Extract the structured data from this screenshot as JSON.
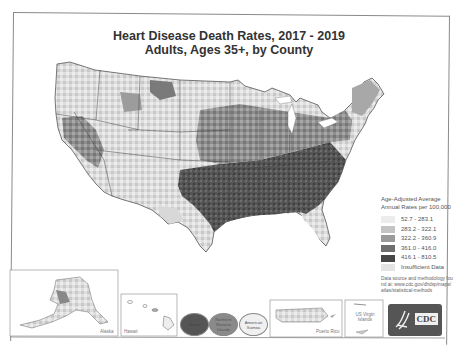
{
  "title": {
    "line1": "Heart Disease Death Rates, 2017 - 2019",
    "line2": "Adults, Ages 35+, by County"
  },
  "legend": {
    "title": "Age-Adjusted Average Annual Rates per 100,000",
    "classes": [
      {
        "label": "52.7 - 283.1",
        "color": "#ececec"
      },
      {
        "label": "283.2 - 322.1",
        "color": "#c4c4c4"
      },
      {
        "label": "322.2 - 360.9",
        "color": "#9a9a9a"
      },
      {
        "label": "361.0 - 416.0",
        "color": "#6e6e6e"
      },
      {
        "label": "416.1 - 810.5",
        "color": "#464646"
      },
      {
        "label": "Insufficient Data",
        "color": "#e3e3e3"
      }
    ]
  },
  "source": {
    "text": "Data source and methodology found at: www.cdc.gov/dhdsp/maps/atlas/statistical-methods"
  },
  "insets": {
    "alaska": "Alaska",
    "hawaii": "Hawaii",
    "guam": "Guam",
    "northern_mariana": "Northern Mariana Islands",
    "american_samoa": "American Samoa",
    "puerto_rico": "Puerto Rico",
    "us_virgin_islands": "US Virgin Islands"
  },
  "logo": {
    "text": "CDC"
  }
}
